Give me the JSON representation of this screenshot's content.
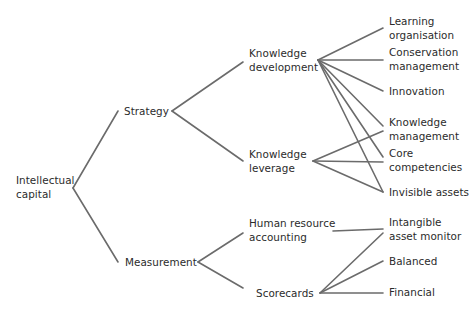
{
  "diagram": {
    "line_color": "#6b6b6b",
    "text_color": "#2b2b2b",
    "background": "#ffffff",
    "nodes": [
      {
        "id": "intellectual-capital",
        "lines": [
          "Intellectual",
          "capital"
        ],
        "x": 16,
        "y": 173
      },
      {
        "id": "strategy",
        "lines": [
          "Strategy"
        ],
        "x": 124,
        "y": 104
      },
      {
        "id": "measurement",
        "lines": [
          "Measurement"
        ],
        "x": 125,
        "y": 255
      },
      {
        "id": "knowledge-development",
        "lines": [
          "Knowledge",
          "development"
        ],
        "x": 249,
        "y": 46
      },
      {
        "id": "knowledge-leverage",
        "lines": [
          "Knowledge",
          "leverage"
        ],
        "x": 249,
        "y": 147
      },
      {
        "id": "human-resource-accounting",
        "lines": [
          "Human resource",
          "accounting"
        ],
        "x": 249,
        "y": 216
      },
      {
        "id": "scorecards",
        "lines": [
          "Scorecards"
        ],
        "x": 256,
        "y": 286
      },
      {
        "id": "learning-organisation",
        "lines": [
          "Learning",
          "organisation"
        ],
        "x": 389,
        "y": 14
      },
      {
        "id": "conservation-management",
        "lines": [
          "Conservation",
          "management"
        ],
        "x": 389,
        "y": 45
      },
      {
        "id": "innovation",
        "lines": [
          "Innovation"
        ],
        "x": 389,
        "y": 84
      },
      {
        "id": "knowledge-management",
        "lines": [
          "Knowledge",
          "management"
        ],
        "x": 389,
        "y": 115
      },
      {
        "id": "core-competencies",
        "lines": [
          "Core",
          "competencies"
        ],
        "x": 389,
        "y": 146
      },
      {
        "id": "invisible-assets",
        "lines": [
          "Invisible assets"
        ],
        "x": 389,
        "y": 185
      },
      {
        "id": "intangible-asset-monitor",
        "lines": [
          "Intangible",
          "asset monitor"
        ],
        "x": 389,
        "y": 215
      },
      {
        "id": "balanced",
        "lines": [
          "Balanced"
        ],
        "x": 389,
        "y": 254
      },
      {
        "id": "financial",
        "lines": [
          "Financial"
        ],
        "x": 389,
        "y": 285
      }
    ],
    "edges": [
      {
        "from": "intellectual-capital",
        "to": "strategy",
        "x1": 73,
        "y1": 188,
        "x2": 118,
        "y2": 111
      },
      {
        "from": "intellectual-capital",
        "to": "measurement",
        "x1": 73,
        "y1": 188,
        "x2": 118,
        "y2": 262
      },
      {
        "from": "strategy",
        "to": "knowledge-development",
        "x1": 172,
        "y1": 111,
        "x2": 243,
        "y2": 62
      },
      {
        "from": "strategy",
        "to": "knowledge-leverage",
        "x1": 172,
        "y1": 111,
        "x2": 243,
        "y2": 161
      },
      {
        "from": "measurement",
        "to": "human-resource-accounting",
        "x1": 198,
        "y1": 262,
        "x2": 243,
        "y2": 233
      },
      {
        "from": "measurement",
        "to": "scorecards",
        "x1": 198,
        "y1": 262,
        "x2": 243,
        "y2": 288
      },
      {
        "from": "knowledge-development",
        "to": "learning-organisation",
        "x1": 318,
        "y1": 60,
        "x2": 383,
        "y2": 28
      },
      {
        "from": "knowledge-development",
        "to": "conservation-management",
        "x1": 318,
        "y1": 60,
        "x2": 383,
        "y2": 60
      },
      {
        "from": "knowledge-development",
        "to": "innovation",
        "x1": 318,
        "y1": 60,
        "x2": 383,
        "y2": 91
      },
      {
        "from": "knowledge-development",
        "to": "knowledge-management",
        "x1": 318,
        "y1": 60,
        "x2": 383,
        "y2": 126
      },
      {
        "from": "knowledge-development",
        "to": "core-competencies",
        "x1": 318,
        "y1": 60,
        "x2": 383,
        "y2": 157
      },
      {
        "from": "knowledge-development",
        "to": "invisible-assets",
        "x1": 318,
        "y1": 60,
        "x2": 383,
        "y2": 192
      },
      {
        "from": "knowledge-leverage",
        "to": "knowledge-management",
        "x1": 313,
        "y1": 161,
        "x2": 383,
        "y2": 131
      },
      {
        "from": "knowledge-leverage",
        "to": "core-competencies",
        "x1": 313,
        "y1": 161,
        "x2": 383,
        "y2": 162
      },
      {
        "from": "knowledge-leverage",
        "to": "invisible-assets",
        "x1": 313,
        "y1": 161,
        "x2": 383,
        "y2": 192
      },
      {
        "from": "human-resource-accounting",
        "to": "intangible-asset-monitor",
        "x1": 333,
        "y1": 231,
        "x2": 383,
        "y2": 229
      },
      {
        "from": "scorecards",
        "to": "intangible-asset-monitor",
        "x1": 320,
        "y1": 293,
        "x2": 383,
        "y2": 233
      },
      {
        "from": "scorecards",
        "to": "balanced",
        "x1": 320,
        "y1": 293,
        "x2": 383,
        "y2": 261
      },
      {
        "from": "scorecards",
        "to": "financial",
        "x1": 320,
        "y1": 293,
        "x2": 383,
        "y2": 293
      }
    ]
  }
}
